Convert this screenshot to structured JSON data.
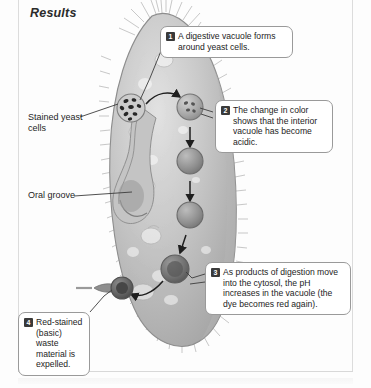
{
  "figure": {
    "title": "Results",
    "palette": {
      "cell_body": "#b9b9b9",
      "cell_body_light": "#dedede",
      "cell_outline": "#8d8d8d",
      "cilia": "#a8a8a8",
      "vacuole_light": "#b4b4b4",
      "vacuole_mid": "#8f8f8f",
      "vacuole_dark": "#6a6a6a",
      "yeast_speck": "#2a2a2a",
      "callout_border": "#9a9a9a",
      "badge_bg": "#3a3a3a",
      "badge_text": "#ffffff",
      "text": "#1d1d1d",
      "rule": "#dcdcdc"
    }
  },
  "callouts": [
    {
      "number": "1",
      "text": "A digestive vacuole forms around yeast cells."
    },
    {
      "number": "2",
      "text": "The change in color shows that the interior vacuole has become acidic."
    },
    {
      "number": "3",
      "text": "As products of digestion move into the cytosol, the pH increases in the vacuole (the dye becomes red again)."
    },
    {
      "number": "4",
      "text": "Red-stained (basic) waste material is expelled."
    }
  ],
  "labels": [
    {
      "id": "stained-yeast-cells",
      "text": "Stained yeast cells"
    },
    {
      "id": "oral-groove",
      "text": "Oral groove"
    }
  ],
  "structures": {
    "organism": "paramecium",
    "vacuole_chain": [
      {
        "stage": "forming",
        "shade": "#b0b0b0",
        "note": "yeast cells being engulfed at oral groove"
      },
      {
        "stage": "newly-formed",
        "shade": "#a9a9a9",
        "note": "vacuole with yeast cells inside"
      },
      {
        "stage": "acidic",
        "shade": "#949494",
        "note": "interior has become acidic"
      },
      {
        "stage": "digesting",
        "shade": "#8a8a8a",
        "note": "digestion proceeding"
      },
      {
        "stage": "ph-rising",
        "shade": "#6f6f6f",
        "note": "pH increases, dye becomes red again"
      },
      {
        "stage": "expelled",
        "shade": "#5e5e5e",
        "note": "waste expelled at anal pore"
      }
    ]
  }
}
